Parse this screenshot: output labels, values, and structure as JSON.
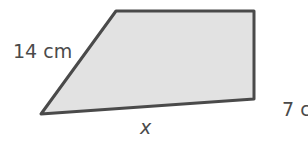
{
  "figure": {
    "type": "quadrilateral",
    "fill_color": "#e2e2e2",
    "stroke_color": "#4a4a4a",
    "vertices": [
      [
        116,
        11
      ],
      [
        254,
        11
      ],
      [
        254,
        99
      ],
      [
        41,
        114
      ]
    ],
    "labels": {
      "slant_side": "14 cm",
      "bottom_side": "x",
      "right_side": "7 c"
    }
  }
}
